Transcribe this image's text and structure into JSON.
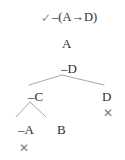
{
  "figure": {
    "type": "semantic-tableau-truth-tree",
    "background_color": "#ffffff",
    "text_color": "#2f2f2f",
    "line_color": "#a9a9a9",
    "mark_color": "#7c7c7c"
  },
  "trunk": [
    {
      "id": "root",
      "label": "–(A→D)",
      "check": "✓",
      "checked": true,
      "x": 52,
      "y": 11
    },
    {
      "id": "premise-a",
      "label": "A",
      "x": 62,
      "y": 37
    },
    {
      "id": "negated-d",
      "label": "–D",
      "x": 61,
      "y": 62
    }
  ],
  "branches": [
    {
      "id": "negated-c",
      "label": "–C",
      "x": 28,
      "y": 90,
      "closed": false
    },
    {
      "id": "positive-d",
      "label": "D",
      "x": 102,
      "y": 90,
      "closed": true,
      "close_mark": "✕",
      "close_x": 103,
      "close_y": 107
    },
    {
      "id": "negated-a",
      "label": "–A",
      "x": 18,
      "y": 123,
      "closed": true,
      "close_mark": "✕",
      "close_x": 19,
      "close_y": 142
    },
    {
      "id": "positive-b",
      "label": "B",
      "x": 57,
      "y": 123,
      "closed": false
    }
  ],
  "lines": [
    {
      "id": "split-d-left",
      "x1": 62,
      "y1": 75,
      "x2": 29,
      "y2": 85
    },
    {
      "id": "split-d-right",
      "x1": 62,
      "y1": 75,
      "x2": 104,
      "y2": 85
    },
    {
      "id": "split-c-left",
      "x1": 30,
      "y1": 102,
      "x2": 16,
      "y2": 117
    },
    {
      "id": "split-c-right",
      "x1": 30,
      "y1": 102,
      "x2": 46,
      "y2": 117
    }
  ]
}
